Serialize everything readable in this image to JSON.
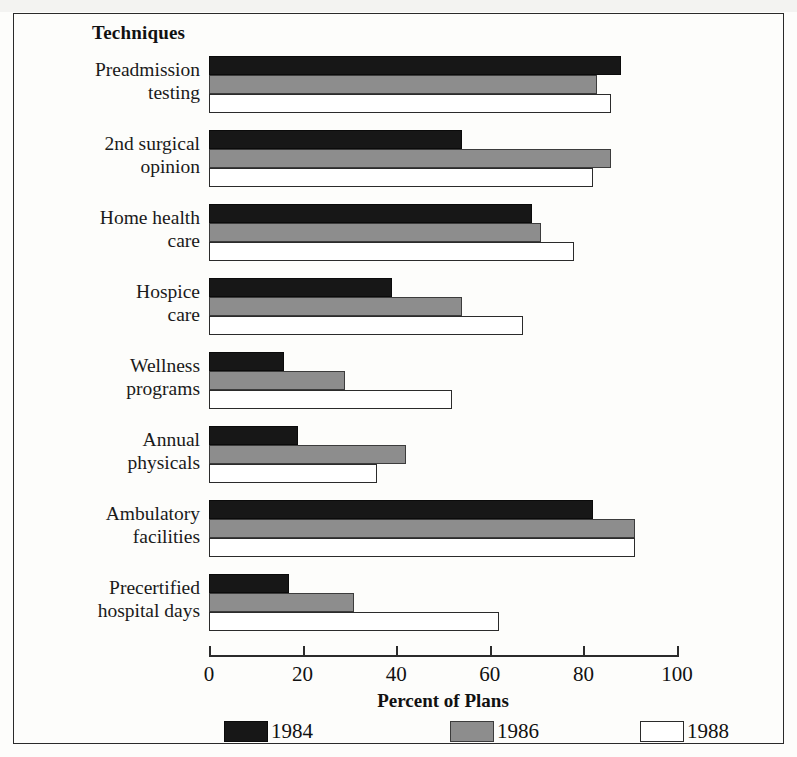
{
  "figure": {
    "legend_title": "Techniques",
    "x_axis_title": "Percent of Plans"
  },
  "axis": {
    "ticks": [
      "0",
      "20",
      "40",
      "60",
      "80",
      "100"
    ]
  },
  "legend": {
    "items": [
      {
        "label": "1984",
        "swatch": "black-swatch",
        "color": "#171717"
      },
      {
        "label": "1986",
        "swatch": "gray-swatch",
        "color": "#8d8d8d"
      },
      {
        "label": "1988",
        "swatch": "white-swatch",
        "color": "#ffffff"
      }
    ]
  },
  "chart_data": {
    "type": "bar",
    "orientation": "horizontal",
    "title": "Techniques",
    "xlabel": "Percent of Plans",
    "ylabel": "",
    "xlim": [
      0,
      100
    ],
    "grid": false,
    "legend_position": "bottom",
    "categories": [
      "Preadmission testing",
      "2nd surgical opinion",
      "Home health care",
      "Hospice care",
      "Wellness programs",
      "Annual physicals",
      "Ambulatory facilities",
      "Precertified hospital days"
    ],
    "category_lines": [
      [
        "Preadmission",
        "testing"
      ],
      [
        "2nd surgical",
        "opinion"
      ],
      [
        "Home health",
        "care"
      ],
      [
        "Hospice",
        "care"
      ],
      [
        "Wellness",
        "programs"
      ],
      [
        "Annual",
        "physicals"
      ],
      [
        "Ambulatory",
        "facilities"
      ],
      [
        "Precertified",
        "hospital days"
      ]
    ],
    "series": [
      {
        "name": "1984",
        "color": "#171717",
        "values": [
          88,
          54,
          69,
          39,
          16,
          19,
          82,
          17
        ]
      },
      {
        "name": "1986",
        "color": "#8d8d8d",
        "values": [
          83,
          86,
          71,
          54,
          29,
          42,
          91,
          31
        ]
      },
      {
        "name": "1988",
        "color": "#ffffff",
        "values": [
          86,
          82,
          78,
          67,
          52,
          36,
          91,
          62
        ]
      }
    ]
  }
}
